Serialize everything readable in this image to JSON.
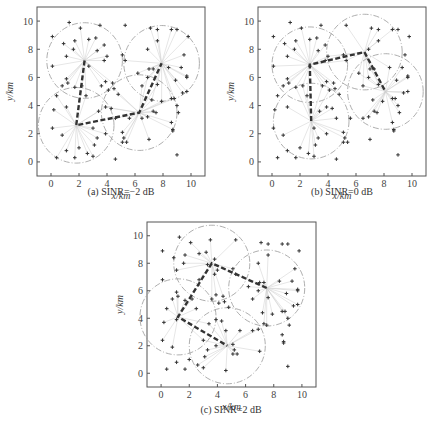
{
  "chart_data": [
    {
      "type": "scatter",
      "title": "(a) SINR=−2 dB",
      "caption": "(a) SINR=−2 dB",
      "xlabel": "x/km",
      "ylabel": "y/km",
      "xlim": [
        -1,
        11
      ],
      "ylim": [
        -1,
        11
      ],
      "xticks": [
        0,
        2,
        4,
        6,
        8,
        10
      ],
      "yticks": [
        0,
        2,
        4,
        6,
        8,
        10
      ],
      "grid": false,
      "coverage_radius": 2.7,
      "base_stations": [
        [
          2.4,
          7.2
        ],
        [
          7.9,
          7.0
        ],
        [
          1.8,
          2.6
        ],
        [
          6.3,
          3.5
        ]
      ],
      "path": [
        [
          2.4,
          7.2
        ],
        [
          1.8,
          2.6
        ],
        [
          6.3,
          3.5
        ],
        [
          7.9,
          7.0
        ]
      ],
      "frame": {
        "left": 37,
        "top": 7,
        "right": 205,
        "bottom": 176
      },
      "caption_pos": {
        "x": 121,
        "y": 192
      }
    },
    {
      "type": "scatter",
      "title": "(b) SINR=0 dB",
      "caption": "(b) SINR=0 dB",
      "xlabel": "x/km",
      "ylabel": "y/km",
      "xlim": [
        -1,
        11
      ],
      "ylim": [
        -1,
        11
      ],
      "xticks": [
        0,
        2,
        4,
        6,
        8,
        10
      ],
      "yticks": [
        0,
        2,
        4,
        6,
        8,
        10
      ],
      "grid": false,
      "coverage_radius": 2.7,
      "base_stations": [
        [
          2.7,
          6.9
        ],
        [
          6.6,
          7.8
        ],
        [
          8.1,
          5.0
        ],
        [
          2.8,
          2.9
        ]
      ],
      "path": [
        [
          2.8,
          2.9
        ],
        [
          2.7,
          6.9
        ],
        [
          6.6,
          7.8
        ],
        [
          8.1,
          5.0
        ]
      ],
      "frame": {
        "left": 258,
        "top": 7,
        "right": 426,
        "bottom": 176
      },
      "caption_pos": {
        "x": 342,
        "y": 192
      }
    },
    {
      "type": "scatter",
      "title": "(c) SINR=2 dB",
      "caption": "(c) SINR=2 dB",
      "xlabel": "x/km",
      "ylabel": "y/km",
      "xlim": [
        -1,
        11
      ],
      "ylim": [
        -1,
        11
      ],
      "xticks": [
        0,
        2,
        4,
        6,
        8,
        10
      ],
      "yticks": [
        0,
        2,
        4,
        6,
        8,
        10
      ],
      "grid": false,
      "coverage_radius": 2.7,
      "base_stations": [
        [
          3.6,
          8.0
        ],
        [
          7.5,
          6.2
        ],
        [
          1.2,
          4.1
        ],
        [
          4.7,
          2.0
        ]
      ],
      "path": [
        [
          7.5,
          6.2
        ],
        [
          3.6,
          8.0
        ],
        [
          1.2,
          4.1
        ],
        [
          4.7,
          2.0
        ]
      ],
      "frame": {
        "left": 147,
        "top": 222,
        "right": 316,
        "bottom": 387
      },
      "caption_pos": {
        "x": 231,
        "y": 410
      }
    }
  ],
  "users": [
    [
      0.1,
      8.9
    ],
    [
      1.3,
      9.9
    ],
    [
      2.1,
      9.5
    ],
    [
      3.5,
      9.7
    ],
    [
      5.3,
      9.7
    ],
    [
      7.1,
      9.5
    ],
    [
      7.6,
      9.4
    ],
    [
      8.6,
      9.4
    ],
    [
      9.0,
      9.4
    ],
    [
      9.8,
      8.9
    ],
    [
      0.9,
      8.4
    ],
    [
      1.7,
      8.6
    ],
    [
      2.7,
      8.7
    ],
    [
      3.2,
      8.8
    ],
    [
      3.8,
      8.3
    ],
    [
      7.6,
      8.6
    ],
    [
      6.9,
      8.0
    ],
    [
      1.6,
      8.0
    ],
    [
      3.3,
      7.9
    ],
    [
      1.1,
      7.5
    ],
    [
      4.0,
      7.5
    ],
    [
      5.1,
      7.6
    ],
    [
      9.5,
      7.6
    ],
    [
      3.8,
      7.2
    ],
    [
      5.3,
      7.2
    ],
    [
      2.7,
      6.8
    ],
    [
      0.1,
      6.8
    ],
    [
      7.0,
      6.6
    ],
    [
      7.3,
      6.6
    ],
    [
      8.4,
      6.7
    ],
    [
      9.3,
      6.7
    ],
    [
      6.2,
      6.3
    ],
    [
      9.7,
      6.1
    ],
    [
      9.7,
      6.0
    ],
    [
      1.1,
      5.9
    ],
    [
      1.2,
      5.6
    ],
    [
      3.9,
      5.7
    ],
    [
      4.4,
      5.6
    ],
    [
      6.9,
      6.0
    ],
    [
      8.9,
      5.8
    ],
    [
      0.8,
      5.4
    ],
    [
      2.2,
      5.4
    ],
    [
      1.7,
      5.3
    ],
    [
      3.6,
      5.4
    ],
    [
      4.5,
      5.2
    ],
    [
      4.1,
      5.1
    ],
    [
      6.5,
      5.4
    ],
    [
      7.6,
      5.5
    ],
    [
      9.7,
      5.0
    ],
    [
      9.4,
      4.9
    ],
    [
      0.4,
      4.7
    ],
    [
      2.5,
      4.7
    ],
    [
      4.8,
      4.8
    ],
    [
      7.2,
      4.4
    ],
    [
      8.6,
      4.5
    ],
    [
      8.8,
      4.5
    ],
    [
      7.9,
      4.3
    ],
    [
      1.1,
      3.9
    ],
    [
      3.9,
      3.9
    ],
    [
      4.3,
      3.8
    ],
    [
      9.0,
      4.0
    ],
    [
      0.2,
      3.7
    ],
    [
      3.4,
      3.6
    ],
    [
      7.3,
      3.6
    ],
    [
      7.5,
      3.5
    ],
    [
      9.1,
      3.5
    ],
    [
      4.6,
      3.1
    ],
    [
      5.6,
      3.1
    ],
    [
      6.5,
      3.1
    ],
    [
      6.9,
      3.2
    ],
    [
      8.6,
      2.8
    ],
    [
      0.1,
      2.4
    ],
    [
      3.0,
      2.4
    ],
    [
      8.7,
      2.3
    ],
    [
      8.7,
      2.2
    ],
    [
      0.8,
      1.9
    ],
    [
      3.9,
      2.0
    ],
    [
      5.1,
      2.1
    ],
    [
      3.3,
      1.7
    ],
    [
      5.2,
      1.7
    ],
    [
      7.0,
      1.6
    ],
    [
      2.0,
      1.0
    ],
    [
      3.1,
      1.2
    ],
    [
      5.1,
      1.4
    ],
    [
      5.4,
      1.4
    ],
    [
      1.1,
      0.8
    ],
    [
      2.6,
      0.6
    ],
    [
      3.0,
      0.4
    ],
    [
      0.4,
      0.3
    ],
    [
      1.7,
      0.3
    ],
    [
      4.6,
      0.2
    ],
    [
      9.0,
      0.5
    ]
  ]
}
